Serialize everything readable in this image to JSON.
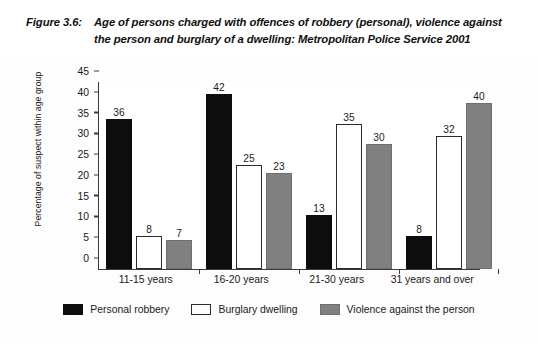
{
  "caption": {
    "figure_number": "Figure 3.6:",
    "text": "Age of persons charged with offences of robbery (personal), violence against the person and burglary of a dwelling: Metropolitan Police Service 2001"
  },
  "colors": {
    "series_personal_robbery": "#0d0d0d",
    "series_burglary_dwelling": "#ffffff",
    "series_violence": "#808080",
    "axis": "#3a3a3a",
    "plot_background": "#ffffff",
    "page_background": "#fdfdfd"
  },
  "chart_data": {
    "type": "bar",
    "title": "Age of persons charged with offences of robbery (personal), violence against the person and burglary of a dwelling: Metropolitan Police Service 2001",
    "xlabel": "",
    "ylabel": "Percentage of suspect within age group",
    "categories": [
      "11-15 years",
      "16-20  years",
      "21-30 years",
      "31 years and over"
    ],
    "series": [
      {
        "name": "Personal robbery",
        "values": [
          36,
          42,
          13,
          8
        ]
      },
      {
        "name": "Burglary dwelling",
        "values": [
          8,
          25,
          35,
          32
        ]
      },
      {
        "name": "Violence against the person",
        "values": [
          7,
          23,
          30,
          40
        ]
      }
    ],
    "ylim": [
      0,
      45
    ],
    "yticks": [
      0,
      5,
      10,
      15,
      20,
      25,
      30,
      35,
      40,
      45
    ],
    "grid": false,
    "legend_position": "bottom",
    "value_labels": true
  }
}
